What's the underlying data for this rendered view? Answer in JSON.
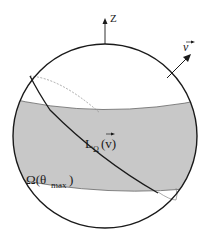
{
  "diagram": {
    "type": "sphere-with-band",
    "colors": {
      "background": "#ffffff",
      "sphere_outline": "#1a1a1a",
      "band_fill": "#c8c8c8",
      "band_edge": "#555555",
      "great_circle": "#1a1a1a",
      "hidden_line": "#777777"
    },
    "labels": {
      "z_axis": "Z",
      "v_vector": "v",
      "great_circle_main": "L",
      "great_circle_sub": "Ω",
      "great_circle_arg": "(v)",
      "band_main": "Ω(θ",
      "band_sub": "max",
      "band_close": ")"
    },
    "elements": [
      {
        "name": "sphere",
        "shape": "circle"
      },
      {
        "name": "z-axis",
        "shape": "arrow",
        "direction": "up"
      },
      {
        "name": "v-vector",
        "shape": "arrow",
        "direction": "up-right"
      },
      {
        "name": "band",
        "shape": "spherical-zone",
        "label": "Ω(θmax)"
      },
      {
        "name": "great-circle",
        "shape": "great-circle",
        "label": "LΩ(v)"
      }
    ]
  }
}
